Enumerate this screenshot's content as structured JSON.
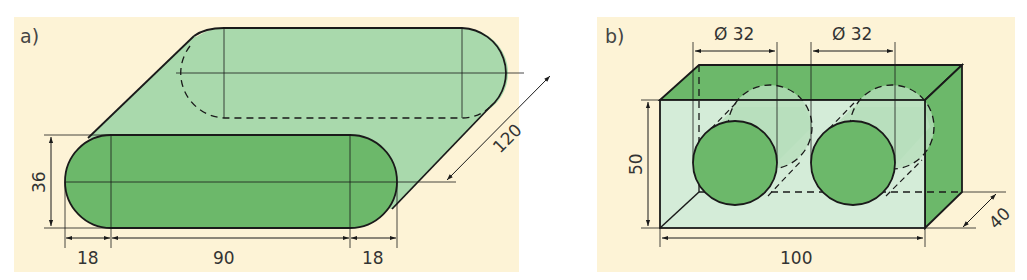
{
  "colors": {
    "background": "#fdf3d6",
    "dark_green": "#6cb86a",
    "light_green": "#a9d9ac",
    "pale_green": "#d4ecd8",
    "line": "#1a1a1a"
  },
  "panel_a": {
    "label": "a)",
    "shape": "stadium-prism",
    "dimensions": {
      "height": "36",
      "left_radius": "18",
      "middle_length": "90",
      "right_radius": "18",
      "depth": "120"
    }
  },
  "panel_b": {
    "label": "b)",
    "shape": "box-with-two-holes",
    "dimensions": {
      "hole1_diameter": "Ø 32",
      "hole2_diameter": "Ø 32",
      "height": "50",
      "width": "100",
      "depth": "40"
    }
  }
}
